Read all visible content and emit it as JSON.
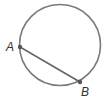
{
  "diagram": {
    "type": "circle-with-chord",
    "circle": {
      "cx": 60,
      "cy": 45,
      "r": 40.5,
      "stroke": "#7a7a7a"
    },
    "chord": {
      "from": "A",
      "to": "B",
      "stroke": "#666666"
    },
    "points": [
      {
        "label": "A",
        "x": 20,
        "y": 47,
        "label_x": 7,
        "label_y": 51
      },
      {
        "label": "B",
        "x": 80,
        "y": 82,
        "label_x": 82,
        "label_y": 96
      }
    ],
    "point_color": "#555555"
  }
}
